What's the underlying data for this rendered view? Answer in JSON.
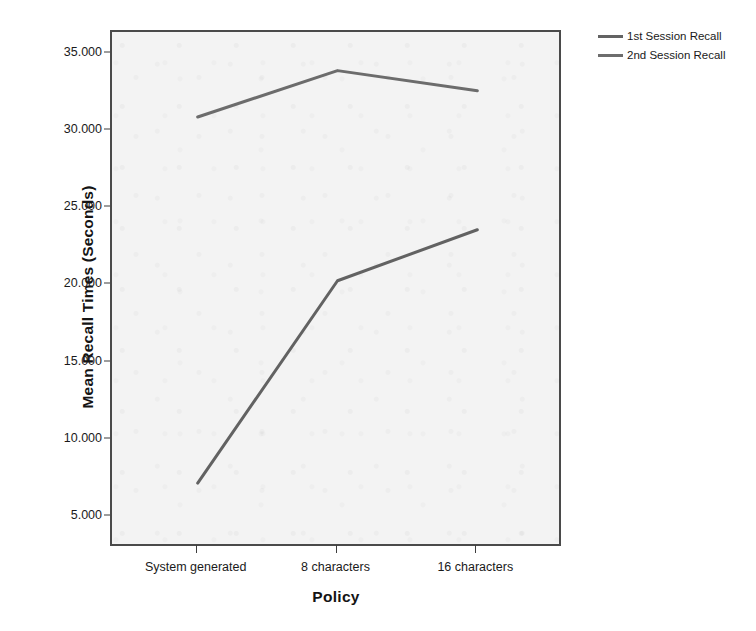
{
  "chart_data": {
    "type": "line",
    "title": "",
    "subtitle": "",
    "xlabel": "Policy",
    "ylabel": "Mean Recall Times (Seconds)",
    "categories": [
      "System generated",
      "8 characters",
      "16 characters"
    ],
    "series": [
      {
        "name": "1st Session Recall",
        "values": [
          7.2,
          20.3,
          23.6
        ],
        "color": "#4d4d4d"
      },
      {
        "name": "2nd Session Recall",
        "values": [
          30.9,
          33.9,
          32.6
        ],
        "color": "#595959"
      }
    ],
    "ylim": [
      3.0,
      36.4
    ],
    "yticks": [
      5,
      10,
      15,
      20,
      25,
      30,
      35
    ],
    "ytick_labels": [
      "5.000",
      "10.000",
      "15.000",
      "20.000",
      "25.000",
      "30.000",
      "35.000"
    ],
    "grid": false,
    "legend_position": "top-right-outside",
    "plot_background": "#f3f3f3",
    "frame_color": "#4a4a4a"
  },
  "legend": {
    "entries": [
      {
        "label": "1st Session Recall"
      },
      {
        "label": "2nd Session Recall"
      }
    ]
  },
  "axes": {
    "y_title": "Mean Recall Times (Seconds)",
    "x_title": "Policy",
    "y_tick_labels": [
      "35.000",
      "30.000",
      "25.000",
      "20.000",
      "15.000",
      "10.000",
      "5.000"
    ],
    "x_tick_labels": [
      "System generated",
      "8 characters",
      "16 characters"
    ]
  }
}
